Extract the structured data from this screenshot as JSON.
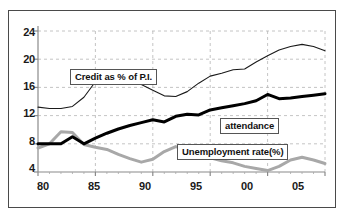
{
  "figure": {
    "background_color": "#ffffff",
    "frame_color": "#4a4a4a"
  },
  "chart_data": {
    "type": "line",
    "title": "",
    "subtitle": "",
    "xlabel": "",
    "ylabel": "",
    "xlim": [
      80,
      105
    ],
    "ylim": [
      4,
      24
    ],
    "grid": true,
    "grid_style": "dashed",
    "legend_position": "inline-callouts",
    "x_tick_labels": [
      "80",
      "85",
      "90",
      "95",
      "00",
      "05"
    ],
    "x_tick_values": [
      80,
      85,
      90,
      95,
      100,
      105
    ],
    "y_tick_labels": [
      "4",
      "8",
      "12",
      "16",
      "20",
      "24"
    ],
    "y_tick_values": [
      4,
      8,
      12,
      16,
      20,
      24
    ],
    "x": [
      80,
      81,
      82,
      83,
      84,
      85,
      86,
      87,
      88,
      89,
      90,
      91,
      92,
      93,
      94,
      95,
      96,
      97,
      98,
      99,
      100,
      101,
      102,
      103,
      104,
      105
    ],
    "series": [
      {
        "name": "Credit as % of P.I.",
        "color": "#1a1a1a",
        "line_width": 1.1,
        "values": [
          13.2,
          13.0,
          13.0,
          13.3,
          14.6,
          16.8,
          16.9,
          16.8,
          16.9,
          16.4,
          15.6,
          14.8,
          14.7,
          15.4,
          16.6,
          17.6,
          18.0,
          18.5,
          18.6,
          19.6,
          20.5,
          21.3,
          21.8,
          22.1,
          21.8,
          21.2
        ]
      },
      {
        "name": "attendance",
        "color": "#000000",
        "line_width": 3.0,
        "values": [
          8.0,
          8.0,
          8.0,
          9.0,
          8.0,
          8.8,
          9.5,
          10.1,
          10.6,
          11.0,
          11.4,
          11.1,
          11.9,
          12.2,
          12.1,
          12.8,
          13.1,
          13.4,
          13.7,
          14.1,
          15.0,
          14.4,
          14.5,
          14.7,
          14.9,
          15.1
        ]
      },
      {
        "name": "Unemployment rate(%)",
        "color": "#a8a8a8",
        "line_width": 3.0,
        "values": [
          7.4,
          8.0,
          9.7,
          9.6,
          7.9,
          7.5,
          7.2,
          6.5,
          5.9,
          5.4,
          5.8,
          6.9,
          7.6,
          7.1,
          6.6,
          6.0,
          5.6,
          5.3,
          4.8,
          4.5,
          4.2,
          4.8,
          5.7,
          6.1,
          5.7,
          5.2
        ]
      }
    ],
    "annotations": [
      {
        "text": "Credit as % of P.I.",
        "series": "Credit as % of P.I."
      },
      {
        "text": "attendance",
        "series": "attendance"
      },
      {
        "text": "Unemployment rate(%)",
        "series": "Unemployment rate(%)"
      }
    ]
  }
}
